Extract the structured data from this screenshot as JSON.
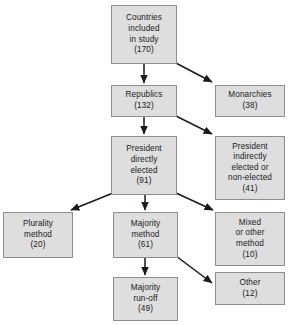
{
  "diagram": {
    "style": {
      "node_fill": "#dedede",
      "node_border": "#8e8e8e",
      "edge_color": "#1a1a1a",
      "background": "#ffffff"
    },
    "nodes": [
      {
        "id": "countries",
        "lines": [
          "Countries",
          "included",
          "in study",
          "(170)"
        ],
        "value": 170,
        "x": 111,
        "y": 5,
        "w": 66,
        "h": 59
      },
      {
        "id": "republics",
        "lines": [
          "Republics",
          "(132)"
        ],
        "value": 132,
        "x": 111,
        "y": 85,
        "w": 66,
        "h": 32
      },
      {
        "id": "monarchies",
        "lines": [
          "Monarchies",
          "(38)"
        ],
        "value": 38,
        "x": 215,
        "y": 85,
        "w": 70,
        "h": 32
      },
      {
        "id": "president-direct",
        "lines": [
          "President",
          "directly",
          "elected",
          "(91)"
        ],
        "value": 91,
        "x": 111,
        "y": 136,
        "w": 66,
        "h": 59
      },
      {
        "id": "president-indirect",
        "lines": [
          "President",
          "indirectly",
          "elected or",
          "non-elected",
          "(41)"
        ],
        "value": 41,
        "x": 215,
        "y": 136,
        "w": 70,
        "h": 64
      },
      {
        "id": "plurality",
        "lines": [
          "Plurality",
          "method",
          "(20)"
        ],
        "value": 20,
        "x": 3,
        "y": 212,
        "w": 70,
        "h": 46
      },
      {
        "id": "majority",
        "lines": [
          "Majority",
          "method",
          "(61)"
        ],
        "value": 61,
        "x": 113,
        "y": 212,
        "w": 65,
        "h": 46
      },
      {
        "id": "mixed",
        "lines": [
          "Mixed",
          "or other",
          "method",
          "(10)"
        ],
        "value": 10,
        "x": 215,
        "y": 212,
        "w": 70,
        "h": 54
      },
      {
        "id": "majority-runoff",
        "lines": [
          "Majority",
          "run-off",
          "(49)"
        ],
        "value": 49,
        "x": 113,
        "y": 277,
        "w": 65,
        "h": 44
      },
      {
        "id": "other",
        "lines": [
          "Other",
          "(12)"
        ],
        "value": 12,
        "x": 215,
        "y": 272,
        "w": 70,
        "h": 33
      }
    ],
    "edges": [
      {
        "id": "countries-to-republics",
        "from": "countries",
        "to": "republics",
        "kind": "vertical"
      },
      {
        "id": "countries-to-monarchies",
        "from": "countries",
        "to": "monarchies",
        "kind": "diagonal"
      },
      {
        "id": "republics-to-president-direct",
        "from": "republics",
        "to": "president-direct",
        "kind": "vertical"
      },
      {
        "id": "republics-to-president-indirect",
        "from": "republics",
        "to": "president-indirect",
        "kind": "diagonal"
      },
      {
        "id": "president-direct-to-plurality",
        "from": "president-direct",
        "to": "plurality",
        "kind": "diagonal"
      },
      {
        "id": "president-direct-to-majority",
        "from": "president-direct",
        "to": "majority",
        "kind": "vertical"
      },
      {
        "id": "president-direct-to-mixed",
        "from": "president-direct",
        "to": "mixed",
        "kind": "diagonal"
      },
      {
        "id": "majority-to-majority-runoff",
        "from": "majority",
        "to": "majority-runoff",
        "kind": "vertical"
      },
      {
        "id": "majority-to-other",
        "from": "majority",
        "to": "other",
        "kind": "diagonal"
      }
    ]
  }
}
